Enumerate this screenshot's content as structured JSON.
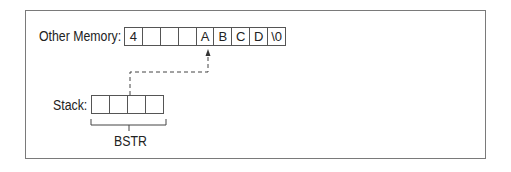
{
  "diagram": {
    "other_memory": {
      "label": "Other Memory:",
      "cells": [
        "4",
        "",
        "",
        "",
        "A",
        "B",
        "C",
        "D",
        "\\0"
      ]
    },
    "stack": {
      "label": "Stack:",
      "cells": [
        "",
        "",
        "",
        ""
      ]
    },
    "bracket_label": "BSTR",
    "pointer": {
      "from": "stack",
      "to": "other_memory.cells.4",
      "style": "dashed-arrow"
    },
    "colors": {
      "border": "#555555",
      "frame": "#7a7a7a",
      "text": "#222222",
      "background": "#ffffff"
    }
  }
}
